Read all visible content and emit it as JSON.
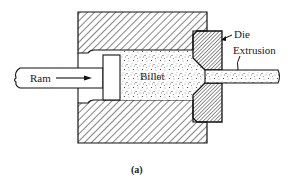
{
  "diagram": {
    "labels": {
      "ram": "Ram",
      "billet": "Billet",
      "die": "Die",
      "extrusion": "Extrusion",
      "caption": "(a)"
    },
    "components": [
      {
        "name": "container",
        "style": "diagonal-hatch"
      },
      {
        "name": "ram",
        "style": "plain"
      },
      {
        "name": "dummy-block",
        "style": "plain"
      },
      {
        "name": "billet",
        "style": "stippled"
      },
      {
        "name": "die",
        "style": "dense-diagonal-hatch"
      },
      {
        "name": "extrusion",
        "style": "stippled"
      }
    ],
    "arrows": [
      {
        "from": "ram-label",
        "direction": "right"
      },
      {
        "from": "die-label",
        "to": "die"
      },
      {
        "from": "extrusion-label",
        "to": "extrusion"
      }
    ]
  }
}
